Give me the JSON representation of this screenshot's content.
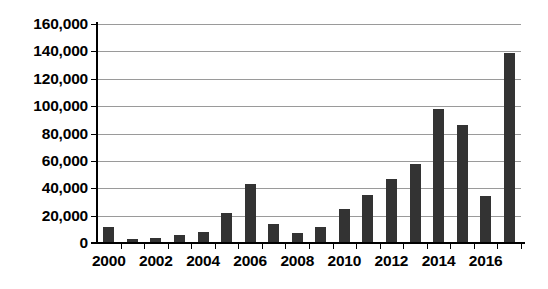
{
  "chart_data": {
    "type": "bar",
    "title": "",
    "subtitle": "",
    "xlabel": "",
    "ylabel": "",
    "categories": [
      "2000",
      "2001",
      "2002",
      "2003",
      "2004",
      "2005",
      "2006",
      "2007",
      "2008",
      "2009",
      "2010",
      "2011",
      "2012",
      "2013",
      "2014",
      "2015",
      "2016",
      "2017"
    ],
    "values": [
      12000,
      3000,
      4000,
      6000,
      8000,
      22000,
      43000,
      14000,
      7000,
      12000,
      25000,
      35000,
      47000,
      58000,
      98000,
      86000,
      34000,
      139000
    ],
    "series": [
      {
        "name": "",
        "values": [
          12000,
          3000,
          4000,
          6000,
          8000,
          22000,
          43000,
          14000,
          7000,
          12000,
          25000,
          35000,
          47000,
          58000,
          98000,
          86000,
          34000,
          139000
        ]
      }
    ],
    "ylim": [
      0,
      160000
    ],
    "ytick_values": [
      0,
      20000,
      40000,
      60000,
      80000,
      100000,
      120000,
      140000,
      160000
    ],
    "ytick_labels": [
      "0",
      "20,000",
      "40,000",
      "60,000",
      "80,000",
      "100,000",
      "120,000",
      "140,000",
      "160,000"
    ],
    "xtick_labels": [
      "2000",
      "2002",
      "2004",
      "2006",
      "2008",
      "2010",
      "2012",
      "2014",
      "2016"
    ],
    "xtick_categories": [
      "2000",
      "2002",
      "2004",
      "2006",
      "2008",
      "2010",
      "2012",
      "2014",
      "2016"
    ],
    "grid": true,
    "grid_axis": "y",
    "legend": false,
    "legend_position": "none",
    "bar_color": "#333333",
    "gridline_color": "#9a9a9a",
    "axis_color": "#000000",
    "background_color": "#ffffff",
    "annotations": []
  }
}
